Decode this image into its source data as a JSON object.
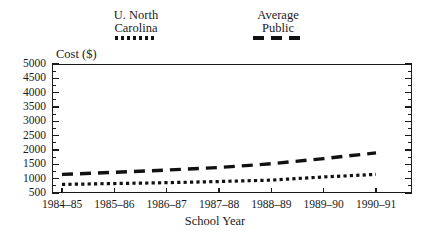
{
  "chart_data": {
    "type": "line",
    "title": "",
    "xlabel": "School Year",
    "ylabel": "Cost ($)",
    "categories": [
      "1984–85",
      "1985–86",
      "1986–87",
      "1987–88",
      "1988–89",
      "1989–90",
      "1990–91"
    ],
    "ylim": [
      500,
      5000
    ],
    "ytick_step": 500,
    "ytick_labels": [
      "5000",
      "4500",
      "4000",
      "3500",
      "3000",
      "2500",
      "2000",
      "1500",
      "1000",
      "500"
    ],
    "ytick_values": [
      5000,
      4500,
      4000,
      3500,
      3000,
      2500,
      2000,
      1500,
      1000,
      500
    ],
    "minor_ticks": true,
    "grid": false,
    "legend_position": "above-plot",
    "series": [
      {
        "name": "U. North Carolina",
        "legend_line1": "U. North",
        "legend_line2": "Carolina",
        "style": "dotted",
        "color": "#111111",
        "values": [
          800,
          830,
          860,
          900,
          950,
          1060,
          1150
        ]
      },
      {
        "name": "Average Public",
        "legend_line1": "Average",
        "legend_line2": "Public",
        "style": "dashed",
        "color": "#111111",
        "values": [
          1150,
          1220,
          1300,
          1390,
          1520,
          1700,
          1900
        ]
      }
    ]
  },
  "axis": {
    "y_title": "Cost ($)",
    "x_title": "School Year"
  },
  "legend": {
    "unc": {
      "line1": "U. North",
      "line2": "Carolina",
      "sample": "dotted-line-sample"
    },
    "avg": {
      "line1": "Average",
      "line2": "Public",
      "sample": "dashed-line-sample"
    }
  }
}
